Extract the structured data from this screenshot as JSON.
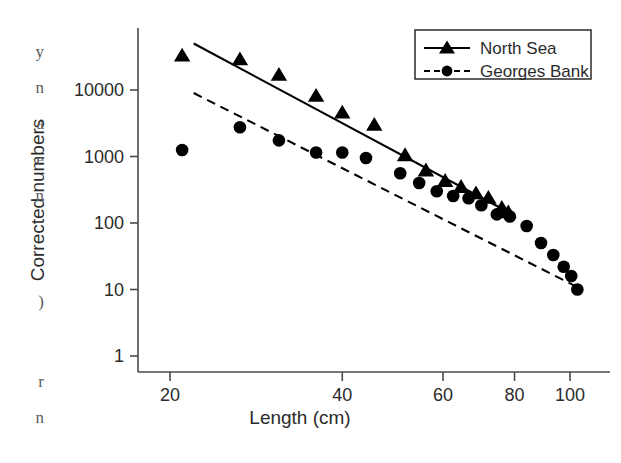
{
  "chart_data": {
    "type": "scatter",
    "title": "",
    "xlabel": "Length (cm)",
    "ylabel": "Corrected numbers",
    "xscale": "log",
    "yscale": "log",
    "xlim": [
      18,
      112
    ],
    "ylim": [
      1,
      70000
    ],
    "xticks": [
      20,
      40,
      60,
      80,
      100
    ],
    "xticklabels": [
      "20",
      "40",
      "60",
      "80",
      "100"
    ],
    "yticks": [
      1,
      10,
      100,
      1000,
      10000
    ],
    "yticklabels": [
      "1",
      "10",
      "100",
      "1000",
      "10000"
    ],
    "grid": false,
    "legend_position": "top-right",
    "series": [
      {
        "name": "North Sea",
        "marker": "triangle",
        "line": "solid",
        "color": "#000000",
        "points": [
          [
            21,
            33000
          ],
          [
            26.5,
            29000
          ],
          [
            31,
            17000
          ],
          [
            36,
            8200
          ],
          [
            40,
            4600
          ],
          [
            45.5,
            3000
          ],
          [
            51.5,
            1050
          ],
          [
            56,
            620
          ],
          [
            60.5,
            430
          ],
          [
            64.5,
            350
          ],
          [
            68.5,
            280
          ],
          [
            72,
            240
          ],
          [
            76,
            170
          ],
          [
            78,
            145
          ]
        ],
        "fit_line": {
          "x": [
            22,
            80
          ],
          "y": [
            50000,
            130
          ]
        }
      },
      {
        "name": "Georges Bank",
        "marker": "circle",
        "line": "dashed",
        "color": "#000000",
        "points": [
          [
            21,
            1250
          ],
          [
            26.5,
            2750
          ],
          [
            31,
            1750
          ],
          [
            36,
            1150
          ],
          [
            40,
            1150
          ],
          [
            44,
            950
          ],
          [
            50.5,
            560
          ],
          [
            54.5,
            400
          ],
          [
            58.5,
            300
          ],
          [
            62.5,
            255
          ],
          [
            66.5,
            235
          ],
          [
            70,
            185
          ],
          [
            74.5,
            135
          ],
          [
            78.5,
            125
          ],
          [
            84,
            90
          ],
          [
            89,
            50
          ],
          [
            93.5,
            33
          ],
          [
            97.5,
            22
          ],
          [
            100.5,
            16
          ],
          [
            103,
            10
          ]
        ],
        "fit_line": {
          "x": [
            22,
            105
          ],
          "y": [
            9000,
            10
          ]
        }
      }
    ]
  },
  "legend": {
    "entries": [
      {
        "label": "North Sea",
        "marker": "triangle",
        "line": "solid"
      },
      {
        "label": "Georges Bank",
        "marker": "circle",
        "line": "dashed"
      }
    ]
  },
  "edge_artifact": {
    "lines": [
      "y",
      "n",
      "a",
      "e",
      "n",
      ")",
      "r",
      "n"
    ]
  }
}
